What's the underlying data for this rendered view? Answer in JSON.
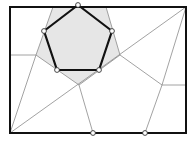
{
  "diagram": {
    "type": "geometric-partition",
    "colors": {
      "background": "#ffffff",
      "frame": "#111111",
      "thin_lines": "#8a8a8a",
      "shaded_cell": "#e6e6e6",
      "pentagon_stroke": "#111111",
      "vertex_fill": "#ffffff",
      "vertex_stroke": "#333333"
    },
    "frame": {
      "x1": 10,
      "y1": 7,
      "x2": 186,
      "y2": 133
    },
    "pentagon": [
      [
        78,
        5
      ],
      [
        112,
        31
      ],
      [
        99,
        70
      ],
      [
        57,
        70
      ],
      [
        44,
        31
      ]
    ],
    "shaded_cell": [
      [
        53,
        7
      ],
      [
        106,
        7
      ],
      [
        120,
        55
      ],
      [
        79,
        85
      ],
      [
        36,
        55
      ]
    ],
    "thin_segments": [
      [
        [
          10,
          133
        ],
        [
          186,
          7
        ]
      ],
      [
        [
          36,
          55
        ],
        [
          10,
          55
        ]
      ],
      [
        [
          36,
          55
        ],
        [
          10,
          133
        ]
      ],
      [
        [
          79,
          85
        ],
        [
          93,
          133
        ]
      ],
      [
        [
          120,
          55
        ],
        [
          162,
          85
        ]
      ],
      [
        [
          162,
          85
        ],
        [
          186,
          85
        ]
      ],
      [
        [
          186,
          7
        ],
        [
          162,
          85
        ]
      ],
      [
        [
          162,
          85
        ],
        [
          145,
          133
        ]
      ]
    ],
    "marked_points": [
      [
        78,
        5
      ],
      [
        112,
        31
      ],
      [
        99,
        70
      ],
      [
        57,
        70
      ],
      [
        44,
        31
      ],
      [
        93,
        133
      ],
      [
        145,
        133
      ]
    ]
  }
}
